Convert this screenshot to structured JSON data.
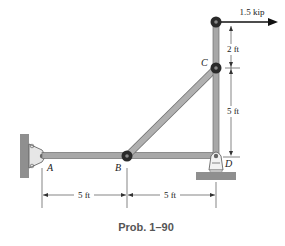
{
  "diagram": {
    "caption": "Prob. 1–90",
    "load": {
      "label": "1.5 kip",
      "direction": "right"
    },
    "points": {
      "A": "A",
      "B": "B",
      "C": "C",
      "D": "D"
    },
    "dimensions": {
      "horizontal": [
        "5 ft",
        "5 ft"
      ],
      "vertical": [
        "2 ft",
        "5 ft"
      ]
    },
    "colors": {
      "member": "#a8a8a8",
      "member_edge": "#6e6e6e",
      "pin": "#2a2a2a",
      "wall": "#8f8f8f",
      "arrow": "#111111"
    }
  }
}
